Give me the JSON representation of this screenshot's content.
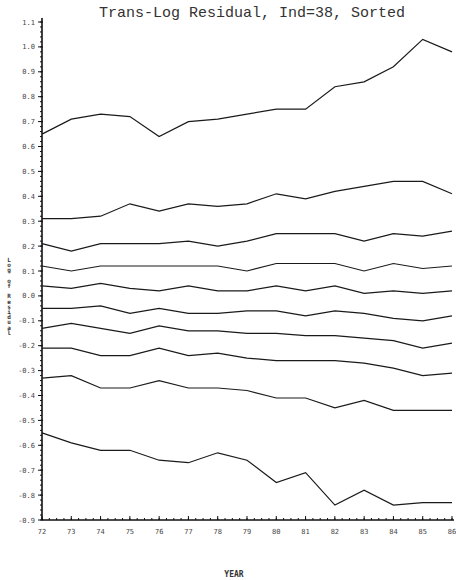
{
  "chart_data": {
    "type": "line",
    "title": "Trans-Log Residual, Ind=38, Sorted",
    "xlabel": "YEAR",
    "ylabel": "Log of Residual",
    "x": [
      72,
      73,
      74,
      75,
      76,
      77,
      78,
      79,
      80,
      81,
      82,
      83,
      84,
      85,
      86
    ],
    "xlim": [
      72,
      86
    ],
    "ylim": [
      -0.9,
      1.1
    ],
    "yticks": [
      "1.1",
      "1.0",
      "0.9",
      "0.8",
      "0.7",
      "0.6",
      "0.5",
      "0.4",
      "0.3",
      "0.2",
      "0.1",
      "0.0",
      "-0.1",
      "-0.2",
      "-0.3",
      "-0.4",
      "-0.5",
      "-0.6",
      "-0.7",
      "-0.8",
      "-0.9"
    ],
    "xticks": [
      "72",
      "73",
      "74",
      "75",
      "76",
      "77",
      "78",
      "79",
      "80",
      "81",
      "82",
      "83",
      "84",
      "85",
      "86"
    ],
    "grid": false,
    "legend": null,
    "series": [
      {
        "name": "series-1",
        "values": [
          0.65,
          0.71,
          0.73,
          0.72,
          0.64,
          0.7,
          0.71,
          0.73,
          0.75,
          0.75,
          0.84,
          0.86,
          0.92,
          1.03,
          0.98
        ]
      },
      {
        "name": "series-2",
        "values": [
          0.31,
          0.31,
          0.32,
          0.37,
          0.34,
          0.37,
          0.36,
          0.37,
          0.41,
          0.39,
          0.42,
          0.44,
          0.46,
          0.46,
          0.41
        ]
      },
      {
        "name": "series-3",
        "values": [
          0.21,
          0.18,
          0.21,
          0.21,
          0.21,
          0.22,
          0.2,
          0.22,
          0.25,
          0.25,
          0.25,
          0.22,
          0.25,
          0.24,
          0.26
        ]
      },
      {
        "name": "series-4",
        "values": [
          0.12,
          0.1,
          0.12,
          0.12,
          0.12,
          0.12,
          0.12,
          0.1,
          0.13,
          0.13,
          0.13,
          0.1,
          0.13,
          0.11,
          0.12
        ]
      },
      {
        "name": "series-5",
        "values": [
          0.04,
          0.03,
          0.05,
          0.03,
          0.02,
          0.04,
          0.02,
          0.02,
          0.04,
          0.02,
          0.04,
          0.01,
          0.02,
          0.01,
          0.02
        ]
      },
      {
        "name": "series-6",
        "values": [
          -0.05,
          -0.05,
          -0.04,
          -0.07,
          -0.05,
          -0.07,
          -0.07,
          -0.06,
          -0.06,
          -0.08,
          -0.06,
          -0.07,
          -0.09,
          -0.1,
          -0.08
        ]
      },
      {
        "name": "series-7",
        "values": [
          -0.13,
          -0.11,
          -0.13,
          -0.15,
          -0.12,
          -0.14,
          -0.14,
          -0.15,
          -0.15,
          -0.16,
          -0.16,
          -0.17,
          -0.18,
          -0.21,
          -0.19
        ]
      },
      {
        "name": "series-8",
        "values": [
          -0.21,
          -0.21,
          -0.24,
          -0.24,
          -0.21,
          -0.24,
          -0.23,
          -0.25,
          -0.26,
          -0.26,
          -0.26,
          -0.27,
          -0.29,
          -0.32,
          -0.31
        ]
      },
      {
        "name": "series-9",
        "values": [
          -0.33,
          -0.32,
          -0.37,
          -0.37,
          -0.34,
          -0.37,
          -0.37,
          -0.38,
          -0.41,
          -0.41,
          -0.45,
          -0.42,
          -0.46,
          -0.46,
          -0.46
        ]
      },
      {
        "name": "series-10",
        "values": [
          -0.55,
          -0.59,
          -0.62,
          -0.62,
          -0.66,
          -0.67,
          -0.63,
          -0.66,
          -0.75,
          -0.71,
          -0.84,
          -0.78,
          -0.84,
          -0.83,
          -0.83
        ]
      }
    ]
  },
  "colors": {
    "line": "#1a1a1a",
    "axis": "#111111",
    "background": "#ffffff"
  }
}
